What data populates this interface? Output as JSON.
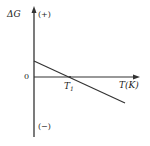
{
  "diagram": {
    "type": "gibbs-free-energy-vs-temperature",
    "y_axis": {
      "label": "ΔG",
      "positive_label": "(+)",
      "negative_label": "(−)"
    },
    "x_axis": {
      "label": "T(K)",
      "origin_label": "0"
    },
    "intercept": {
      "label_main": "T",
      "label_sub": "1"
    },
    "line": {
      "description": "ΔG decreases linearly with T, positive below T1, negative above T1",
      "start": [
        34,
        61
      ],
      "end": [
        125,
        103
      ]
    },
    "colors": {
      "axis": "#333333",
      "line": "#333333",
      "text": "#222222",
      "background": "#ffffff"
    }
  }
}
